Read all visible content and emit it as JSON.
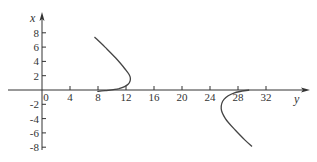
{
  "chart_data": {
    "type": "line",
    "title": "",
    "xlabel": "y",
    "ylabel": "x",
    "note": "Horizontal axis is labeled y, vertical axis is labeled x",
    "horizontal_axis": {
      "label": "y",
      "range": [
        -1,
        38
      ],
      "ticks": [
        0,
        4,
        8,
        12,
        16,
        20,
        24,
        28,
        32
      ],
      "tick_labels": [
        "0",
        "4",
        "8",
        "12",
        "16",
        "20",
        "24",
        "28",
        "32"
      ]
    },
    "vertical_axis": {
      "label": "x",
      "range": [
        -8.2,
        10.8
      ],
      "ticks": [
        8,
        6,
        4,
        2,
        -2,
        -4,
        -6,
        -8
      ],
      "tick_labels": [
        "8",
        "6",
        "4",
        "2",
        "-2",
        "-4",
        "-6",
        "-8"
      ]
    },
    "grid": false,
    "legend": null,
    "series": [
      {
        "name": "curve-upper",
        "points": [
          {
            "y": 7.5,
            "x": 7.4
          },
          {
            "y": 9.0,
            "x": 6.0
          },
          {
            "y": 10.5,
            "x": 4.5
          },
          {
            "y": 11.8,
            "x": 3.0
          },
          {
            "y": 12.6,
            "x": 1.8
          },
          {
            "y": 12.3,
            "x": 0.8
          },
          {
            "y": 11.0,
            "x": 0.2
          },
          {
            "y": 9.0,
            "x": -0.1
          },
          {
            "y": 7.9,
            "x": -0.2
          }
        ]
      },
      {
        "name": "curve-lower",
        "points": [
          {
            "y": 29.6,
            "x": 0.0
          },
          {
            "y": 27.5,
            "x": -0.4
          },
          {
            "y": 26.0,
            "x": -1.3
          },
          {
            "y": 25.6,
            "x": -2.6
          },
          {
            "y": 26.2,
            "x": -4.0
          },
          {
            "y": 27.6,
            "x": -5.6
          },
          {
            "y": 29.0,
            "x": -7.0
          },
          {
            "y": 30.0,
            "x": -7.9
          }
        ]
      }
    ]
  },
  "labels": {
    "vertical_axis_name": "x",
    "horizontal_axis_name": "y",
    "origin": "0"
  },
  "style": {
    "axis_color": "#333333",
    "curve_color": "#444444"
  }
}
